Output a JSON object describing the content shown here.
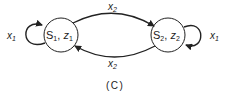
{
  "diagram": {
    "caption": "(C)",
    "states": [
      {
        "name": "S",
        "sub": "1",
        "output": "z",
        "output_sub": "1"
      },
      {
        "name": "S",
        "sub": "2",
        "output": "z",
        "output_sub": "2"
      }
    ],
    "transitions": [
      {
        "from": "S1",
        "to": "S1",
        "label": "x",
        "label_sub": "1"
      },
      {
        "from": "S1",
        "to": "S2",
        "label": "x",
        "label_sub": "2"
      },
      {
        "from": "S2",
        "to": "S1",
        "label": "x",
        "label_sub": "2"
      },
      {
        "from": "S2",
        "to": "S2",
        "label": "x",
        "label_sub": "1"
      }
    ],
    "colors": {
      "stroke": "#222222",
      "background": "#ffffff"
    }
  }
}
